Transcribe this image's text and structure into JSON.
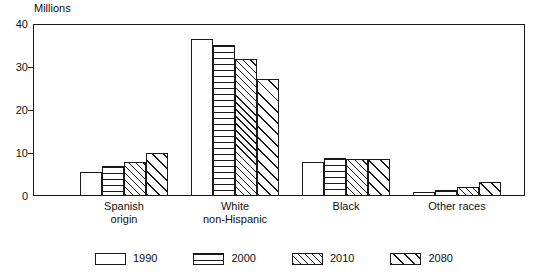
{
  "chart_data": {
    "type": "bar",
    "title": "",
    "subtitle": "",
    "unit_caption": "Millions",
    "xlabel": "",
    "ylabel": "Millions",
    "ylim": [
      0,
      40
    ],
    "yticks": [
      0,
      10,
      20,
      30,
      40
    ],
    "ytick_labels": [
      "0",
      "10",
      "20",
      "30",
      "40"
    ],
    "grid": false,
    "legend_position": "bottom",
    "categories": [
      "Spanish origin",
      "White non-Hispanic",
      "Black",
      "Other races"
    ],
    "category_lines": [
      [
        "Spanish",
        "origin"
      ],
      [
        "White",
        "non-Hispanic"
      ],
      [
        "Black",
        ""
      ],
      [
        "Other races",
        ""
      ]
    ],
    "series": [
      {
        "name": "1990",
        "pattern": "blank",
        "values": [
          5.5,
          36.4,
          8.0,
          1.0
        ]
      },
      {
        "name": "2000",
        "pattern": "horizontal",
        "values": [
          7.0,
          35.1,
          8.8,
          1.3
        ]
      },
      {
        "name": "2010",
        "pattern": "diag-dense",
        "values": [
          8.0,
          31.8,
          8.7,
          2.1
        ]
      },
      {
        "name": "2080",
        "pattern": "diag-wide",
        "values": [
          10.0,
          27.1,
          8.6,
          3.3
        ]
      }
    ],
    "annotations": []
  },
  "legend": {
    "items": [
      {
        "label": "1990"
      },
      {
        "label": "2000"
      },
      {
        "label": "2010"
      },
      {
        "label": "2080"
      }
    ]
  },
  "colors": {
    "ink": "#1a1a1a",
    "background": "#ffffff"
  }
}
